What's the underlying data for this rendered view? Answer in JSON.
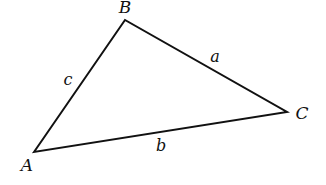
{
  "diagram": {
    "type": "triangle",
    "stroke_color": "#111111",
    "vertices": [
      {
        "label": "A",
        "x": 34,
        "y": 152,
        "label_x": 27,
        "label_y": 171
      },
      {
        "label": "B",
        "x": 125,
        "y": 20,
        "label_x": 125,
        "label_y": 13
      },
      {
        "label": "C",
        "x": 287,
        "y": 112,
        "label_x": 302,
        "label_y": 119
      }
    ],
    "sides": [
      {
        "label": "a",
        "between": "B-C",
        "label_x": 215,
        "label_y": 62
      },
      {
        "label": "b",
        "between": "A-C",
        "label_x": 161,
        "label_y": 151
      },
      {
        "label": "c",
        "between": "A-B",
        "label_x": 68,
        "label_y": 85
      }
    ]
  }
}
